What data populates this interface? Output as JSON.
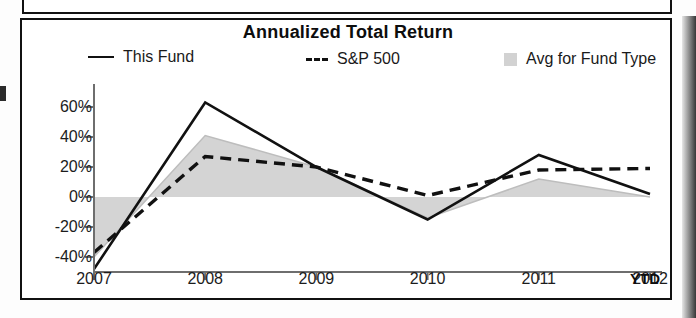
{
  "chart_data": {
    "type": "line",
    "title": "Annualized Total Return",
    "xlabel": "",
    "ylabel": "",
    "ylim": [
      -50,
      70
    ],
    "ytick_labels": [
      "60%",
      "40%",
      "20%",
      "0%",
      "-20%",
      "-40%"
    ],
    "ytick_values": [
      60,
      40,
      20,
      0,
      -20,
      -40
    ],
    "categories": [
      "2007",
      "2008",
      "2009",
      "2010",
      "2011",
      "2012"
    ],
    "x_axis_suffix": "YTD",
    "grid": false,
    "legend_position": "top",
    "series": [
      {
        "name": "This Fund",
        "style": "solid-line",
        "color": "#111111",
        "values": [
          -48,
          63,
          20,
          -15,
          28,
          2
        ]
      },
      {
        "name": "S&P 500",
        "style": "dashed-line",
        "color": "#111111",
        "values": [
          -37,
          27,
          20,
          1,
          18,
          19
        ]
      },
      {
        "name": "Avg for Fund Type",
        "style": "filled-area",
        "color": "#d2d2d2",
        "values": [
          -40,
          41,
          20,
          -14,
          12,
          0
        ]
      }
    ]
  },
  "chart": {
    "title": "Annualized Total Return",
    "legend": [
      {
        "label": "This Fund",
        "marker": "solid-line-swatch"
      },
      {
        "label": "S&P 500",
        "marker": "dashed-line-swatch"
      },
      {
        "label": "Avg for Fund Type",
        "marker": "shaded-box-swatch"
      }
    ],
    "y_axis": {
      "ticks": [
        "60%",
        "40%",
        "20%",
        "0%",
        "-20%",
        "-40%"
      ]
    },
    "x_axis": {
      "ticks": [
        "2007",
        "2008",
        "2009",
        "2010",
        "2011",
        "2012"
      ],
      "suffix": "YTD"
    }
  }
}
